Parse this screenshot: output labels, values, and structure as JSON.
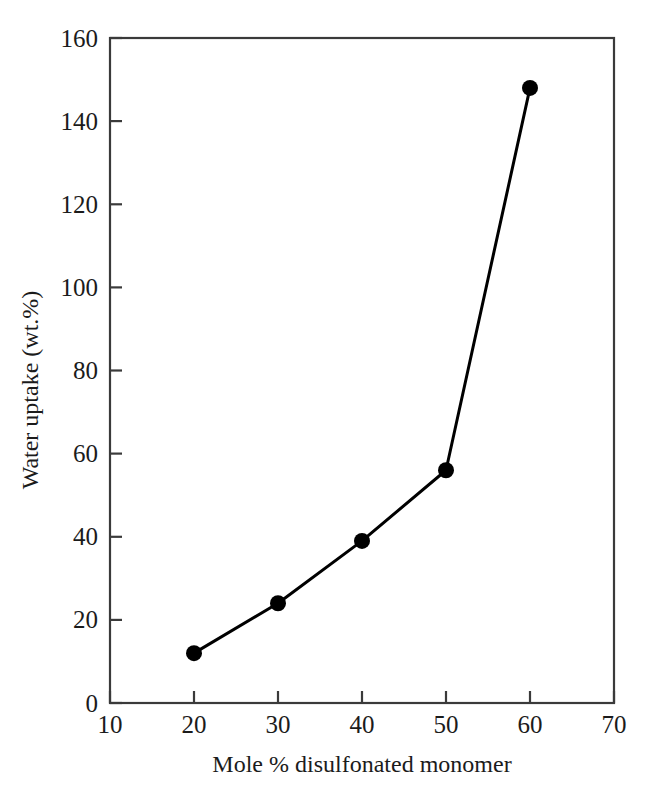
{
  "chart_data": {
    "type": "line",
    "title": "",
    "subtitle": "",
    "xlabel": "Mole % disulfonated monomer",
    "ylabel": "Water uptake (wt.%)",
    "xlim": [
      10,
      70
    ],
    "ylim": [
      0,
      160
    ],
    "xticks": [
      10,
      20,
      30,
      40,
      50,
      60,
      70
    ],
    "yticks": [
      0,
      20,
      40,
      60,
      80,
      100,
      120,
      140,
      160
    ],
    "xtick_labels": [
      "10",
      "20",
      "30",
      "40",
      "50",
      "60",
      "70"
    ],
    "ytick_labels": [
      "0",
      "20",
      "40",
      "60",
      "80",
      "100",
      "120",
      "140",
      "160"
    ],
    "grid": false,
    "legend": false,
    "legend_position": "none",
    "x": [
      20,
      30,
      40,
      50,
      60
    ],
    "values": [
      12,
      24,
      39,
      56,
      148
    ],
    "series": [
      {
        "name": "Water uptake",
        "x": [
          20,
          30,
          40,
          50,
          60
        ],
        "values": [
          12,
          24,
          39,
          56,
          148
        ],
        "marker": "filled-circle",
        "marker_color": "#000000",
        "line_color": "#000000",
        "line_width": 3,
        "marker_size": 16
      }
    ],
    "annotations": [],
    "colors": {
      "line": "#000000",
      "marker": "#000000",
      "axis": "#3a3a3a",
      "text": "#1b1b1b",
      "background": "#ffffff"
    }
  },
  "axes": {
    "x_title": "Mole % disulfonated monomer",
    "y_title": "Water uptake (wt.%)"
  },
  "ticks": {
    "x": [
      {
        "value": 10,
        "label": "10"
      },
      {
        "value": 20,
        "label": "20"
      },
      {
        "value": 30,
        "label": "30"
      },
      {
        "value": 40,
        "label": "40"
      },
      {
        "value": 50,
        "label": "50"
      },
      {
        "value": 60,
        "label": "60"
      },
      {
        "value": 70,
        "label": "70"
      }
    ],
    "y": [
      {
        "value": 0,
        "label": "0"
      },
      {
        "value": 20,
        "label": "20"
      },
      {
        "value": 40,
        "label": "40"
      },
      {
        "value": 60,
        "label": "60"
      },
      {
        "value": 80,
        "label": "80"
      },
      {
        "value": 100,
        "label": "100"
      },
      {
        "value": 120,
        "label": "120"
      },
      {
        "value": 140,
        "label": "140"
      },
      {
        "value": 160,
        "label": "160"
      }
    ]
  },
  "points": [
    {
      "x": 20,
      "y": 12
    },
    {
      "x": 30,
      "y": 24
    },
    {
      "x": 40,
      "y": 39
    },
    {
      "x": 50,
      "y": 56
    },
    {
      "x": 60,
      "y": 148
    }
  ]
}
